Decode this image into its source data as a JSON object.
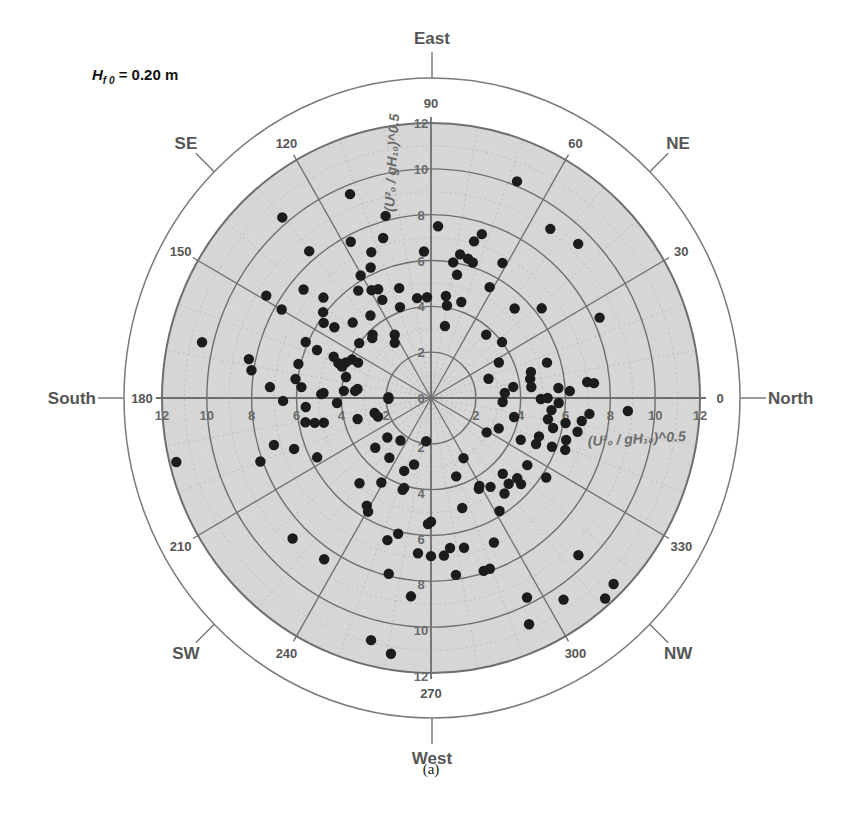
{
  "annotation": {
    "variable": "H",
    "subscript": "f 0",
    "rest": " = 0.20 m"
  },
  "caption": "(a)",
  "colors": {
    "plot_fill": "#dcdcdc",
    "grid": "#6e6e6e",
    "minor_grid": "#b5b5b5",
    "marker": "#1c1c1c",
    "outer_ring": "#7a7a7a",
    "text": "#555555"
  },
  "chart_data": {
    "type": "scatter",
    "subtype": "polar",
    "caption": "(a)",
    "radial_axis": {
      "label": "(U²₀ / gH₁₀)^0.5",
      "range": [
        0,
        12
      ],
      "ticks": [
        0,
        2,
        4,
        6,
        8,
        10,
        12
      ]
    },
    "angular_axis": {
      "unit": "degrees",
      "zero_direction": "right",
      "direction": "counterclockwise",
      "ticks": [
        0,
        30,
        60,
        90,
        120,
        150,
        180,
        210,
        240,
        270,
        300,
        330
      ]
    },
    "compass_labels": [
      {
        "label": "North",
        "angle": 0
      },
      {
        "label": "NE",
        "angle": 45
      },
      {
        "label": "East",
        "angle": 90
      },
      {
        "label": "SE",
        "angle": 135
      },
      {
        "label": "South",
        "angle": 180
      },
      {
        "label": "SW",
        "angle": 225
      },
      {
        "label": "West",
        "angle": 270
      },
      {
        "label": "NW",
        "angle": 315
      }
    ],
    "grid": true,
    "legend": null,
    "points_theta_r": [
      [
        67.9,
        10.2
      ],
      [
        87.6,
        7.5
      ],
      [
        54.2,
        9.1
      ],
      [
        45.7,
        9.4
      ],
      [
        72.4,
        7.5
      ],
      [
        74.3,
        7.1
      ],
      [
        78.3,
        6.4
      ],
      [
        80.5,
        6.0
      ],
      [
        74.8,
        6.3
      ],
      [
        72.5,
        6.2
      ],
      [
        61.6,
        6.7
      ],
      [
        77.8,
        5.5
      ],
      [
        61.6,
        5.5
      ],
      [
        81.5,
        4.5
      ],
      [
        80.0,
        4.1
      ],
      [
        72.1,
        4.4
      ],
      [
        46.3,
        5.4
      ],
      [
        38.4,
        6.3
      ],
      [
        25.0,
        8.3
      ],
      [
        78.8,
        3.2
      ],
      [
        48.3,
        3.7
      ],
      [
        37.6,
        4.0
      ],
      [
        27.1,
        3.4
      ],
      [
        16.6,
        5.4
      ],
      [
        18.1,
        2.7
      ],
      [
        14.3,
        4.6
      ],
      [
        10.6,
        4.5
      ],
      [
        6.1,
        4.5
      ],
      [
        7.5,
        3.7
      ],
      [
        3.8,
        3.3
      ],
      [
        4.4,
        5.7
      ],
      [
        2.8,
        6.2
      ],
      [
        5.7,
        7.0
      ],
      [
        5.1,
        7.3
      ],
      [
        359.5,
        4.9
      ],
      [
        0.0,
        5.2
      ],
      [
        356.9,
        3.2
      ],
      [
        357.8,
        5.7
      ],
      [
        354.4,
        5.4
      ],
      [
        356.3,
        8.8
      ],
      [
        354.4,
        7.1
      ],
      [
        347.4,
        3.8
      ],
      [
        349.9,
        5.3
      ],
      [
        349.7,
        6.1
      ],
      [
        351.5,
        6.8
      ],
      [
        346.5,
        5.6
      ],
      [
        336.3,
        3.3
      ],
      [
        328.9,
        2.9
      ],
      [
        347.3,
        6.7
      ],
      [
        340.8,
        5.1
      ],
      [
        335.5,
        4.4
      ],
      [
        343.1,
        6.3
      ],
      [
        336.8,
        5.1
      ],
      [
        338.5,
        5.8
      ],
      [
        339.3,
        6.4
      ],
      [
        298.9,
        3.0
      ],
      [
        325.7,
        5.2
      ],
      [
        314.1,
        4.6
      ],
      [
        288.2,
        3.6
      ],
      [
        317.7,
        5.2
      ],
      [
        326.0,
        6.2
      ],
      [
        299.4,
        4.4
      ],
      [
        304.4,
        4.7
      ],
      [
        312.8,
        5.1
      ],
      [
        316.9,
        5.5
      ],
      [
        298.3,
        4.5
      ],
      [
        308.2,
        5.3
      ],
      [
        286.2,
        5.0
      ],
      [
        301.8,
        5.8
      ],
      [
        270.0,
        5.4
      ],
      [
        294.0,
        6.9
      ],
      [
        277.4,
        6.6
      ],
      [
        282.7,
        6.7
      ],
      [
        274.8,
        6.9
      ],
      [
        270.0,
        6.9
      ],
      [
        313.8,
        9.5
      ],
      [
        289.4,
        7.9
      ],
      [
        287.3,
        7.9
      ],
      [
        278.2,
        7.8
      ],
      [
        315.1,
        11.5
      ],
      [
        311.6,
        11.7
      ],
      [
        296.2,
        9.7
      ],
      [
        303.9,
        10.6
      ],
      [
        293.9,
        10.8
      ],
      [
        112.1,
        9.6
      ],
      [
        130.1,
        10.3
      ],
      [
        104.3,
        8.2
      ],
      [
        107.0,
        7.3
      ],
      [
        117.7,
        7.7
      ],
      [
        130.3,
        8.4
      ],
      [
        112.7,
        6.9
      ],
      [
        92.8,
        6.4
      ],
      [
        115.3,
        6.3
      ],
      [
        120.4,
        6.2
      ],
      [
        106.5,
        5.0
      ],
      [
        124.7,
        5.7
      ],
      [
        119.4,
        5.4
      ],
      [
        116.4,
        5.3
      ],
      [
        116.9,
        4.8
      ],
      [
        98.1,
        4.4
      ],
      [
        92.3,
        4.4
      ],
      [
        140.2,
        7.4
      ],
      [
        148.7,
        8.6
      ],
      [
        137.6,
        6.5
      ],
      [
        109.2,
        4.2
      ],
      [
        149.9,
        7.7
      ],
      [
        142.1,
        6.1
      ],
      [
        126.9,
        4.5
      ],
      [
        136.7,
        4.8
      ],
      [
        145.6,
        5.8
      ],
      [
        144.4,
        5.3
      ],
      [
        133.3,
        3.8
      ],
      [
        135.1,
        3.7
      ],
      [
        120.4,
        3.2
      ],
      [
        123.9,
        2.9
      ],
      [
        143.2,
        4.0
      ],
      [
        156.4,
        6.1
      ],
      [
        166.6,
        10.5
      ],
      [
        157.6,
        5.5
      ],
      [
        157.5,
        4.7
      ],
      [
        154.5,
        3.9
      ],
      [
        159.8,
        4.4
      ],
      [
        161.0,
        4.2
      ],
      [
        165.9,
        6.1
      ],
      [
        168.2,
        8.3
      ],
      [
        171.4,
        8.1
      ],
      [
        166.4,
        3.9
      ],
      [
        172.2,
        6.1
      ],
      [
        175.3,
        5.8
      ],
      [
        176.2,
        7.2
      ],
      [
        175.4,
        3.9
      ],
      [
        173.2,
        3.3
      ],
      [
        177.4,
        4.8
      ],
      [
        178.8,
        1.9
      ],
      [
        154.6,
        3.6
      ],
      [
        157.7,
        4.1
      ],
      [
        174.8,
        3.4
      ],
      [
        181.1,
        6.6
      ],
      [
        184.0,
        5.6
      ],
      [
        178.0,
        4.9
      ],
      [
        183.0,
        4.2
      ],
      [
        181.2,
        1.9
      ],
      [
        190.7,
        5.7
      ],
      [
        191.8,
        5.3
      ],
      [
        192.7,
        4.9
      ],
      [
        195.6,
        3.4
      ],
      [
        194.6,
        2.6
      ],
      [
        199.0,
        2.5
      ],
      [
        196.3,
        7.3
      ],
      [
        200.0,
        6.5
      ],
      [
        207.0,
        5.7
      ],
      [
        200.0,
        8.1
      ],
      [
        193.8,
        11.7
      ],
      [
        221.5,
        2.6
      ],
      [
        233.7,
        2.3
      ],
      [
        263.5,
        1.9
      ],
      [
        221.1,
        3.3
      ],
      [
        234.5,
        3.2
      ],
      [
        255.4,
        3.0
      ],
      [
        249.4,
        3.4
      ],
      [
        229.4,
        4.9
      ],
      [
        239.0,
        4.3
      ],
      [
        253.0,
        4.1
      ],
      [
        238.6,
        5.5
      ],
      [
        240.5,
        5.7
      ],
      [
        268.6,
        5.5
      ],
      [
        256.1,
        6.1
      ],
      [
        252.6,
        6.5
      ],
      [
        224.8,
        8.7
      ],
      [
        265.1,
        6.8
      ],
      [
        235.9,
        8.5
      ],
      [
        256.2,
        7.9
      ],
      [
        264.1,
        8.7
      ],
      [
        255.8,
        10.9
      ],
      [
        260.9,
        11.3
      ],
      [
        252.5,
        4.2
      ]
    ]
  }
}
